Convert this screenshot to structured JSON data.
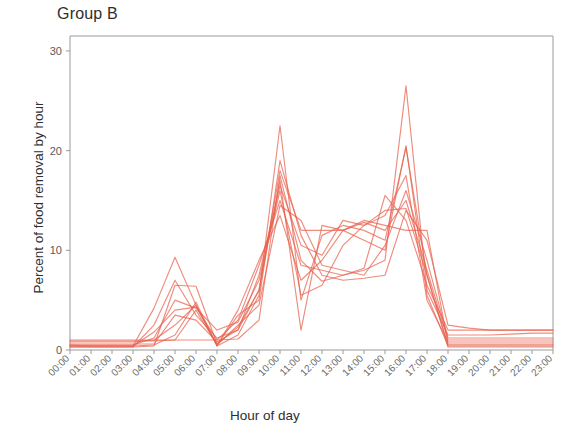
{
  "chart_data": {
    "type": "line",
    "title": "Group B",
    "xlabel": "Hour of day",
    "ylabel": "Percent of food removal by hour",
    "grid": false,
    "legend": false,
    "legend_position": "none",
    "line_color": "#e8604c",
    "line_opacity": 0.72,
    "ylim": [
      0,
      31.5
    ],
    "yticks": [
      0,
      10,
      20,
      30
    ],
    "ytick_labels": [
      "0",
      "10",
      "20",
      "30"
    ],
    "xlim": [
      0,
      23
    ],
    "x": [
      0,
      1,
      2,
      3,
      4,
      5,
      6,
      7,
      8,
      9,
      10,
      11,
      12,
      13,
      14,
      15,
      16,
      17,
      18,
      19,
      20,
      21,
      22,
      23
    ],
    "categories": [
      "00:00",
      "01:00",
      "02:00",
      "03:00",
      "04:00",
      "05:00",
      "06:00",
      "07:00",
      "08:00",
      "09:00",
      "10:00",
      "11:00",
      "12:00",
      "13:00",
      "14:00",
      "15:00",
      "16:00",
      "17:00",
      "18:00",
      "19:00",
      "20:00",
      "21:00",
      "22:00",
      "23:00"
    ],
    "series": [
      {
        "name": "subject-1",
        "values": [
          1.0,
          1.0,
          1.0,
          1.0,
          1.0,
          1.0,
          1.0,
          1.0,
          1.1,
          3.0,
          17.5,
          9.0,
          6.9,
          7.5,
          8.0,
          9.0,
          26.5,
          6.0,
          1.5,
          1.5,
          1.5,
          1.6,
          1.7,
          1.7
        ]
      },
      {
        "name": "subject-2",
        "values": [
          0.5,
          0.4,
          0.4,
          0.4,
          4.2,
          9.3,
          4.5,
          0.4,
          1.5,
          5.5,
          22.5,
          5.0,
          11.5,
          12.5,
          12.0,
          11.0,
          20.3,
          7.5,
          0.5,
          0.5,
          0.5,
          0.5,
          0.5,
          0.5
        ]
      },
      {
        "name": "subject-3",
        "values": [
          0.3,
          0.3,
          0.3,
          0.3,
          0.4,
          6.5,
          6.4,
          0.6,
          2.3,
          6.0,
          18.0,
          12.0,
          12.0,
          12.0,
          12.8,
          12.0,
          15.0,
          8.0,
          1.0,
          1.0,
          1.0,
          1.0,
          1.0,
          1.0
        ]
      },
      {
        "name": "subject-4",
        "values": [
          0.6,
          0.6,
          0.6,
          0.6,
          0.6,
          3.5,
          3.0,
          0.8,
          2.0,
          7.5,
          16.5,
          10.5,
          9.5,
          13.0,
          12.5,
          14.0,
          14.2,
          7.5,
          0.3,
          0.3,
          0.3,
          0.3,
          0.3,
          0.3
        ]
      },
      {
        "name": "subject-5",
        "values": [
          0.4,
          0.4,
          0.4,
          0.4,
          1.8,
          4.0,
          4.3,
          1.0,
          3.0,
          8.5,
          15.0,
          8.5,
          8.0,
          7.5,
          8.2,
          15.5,
          13.0,
          6.5,
          2.0,
          2.0,
          2.0,
          2.0,
          2.0,
          2.0
        ]
      },
      {
        "name": "subject-6",
        "values": [
          0.8,
          0.8,
          0.8,
          0.8,
          1.0,
          2.5,
          4.5,
          0.5,
          2.5,
          4.5,
          14.5,
          13.0,
          8.5,
          8.0,
          7.5,
          10.5,
          16.0,
          9.0,
          1.2,
          1.2,
          1.2,
          1.2,
          1.2,
          1.2
        ]
      },
      {
        "name": "subject-7",
        "values": [
          0.4,
          0.4,
          0.4,
          0.4,
          0.5,
          1.5,
          4.8,
          0.4,
          4.0,
          9.0,
          13.5,
          7.0,
          9.0,
          12.0,
          11.0,
          10.0,
          20.5,
          5.5,
          0.4,
          0.4,
          0.4,
          0.4,
          0.4,
          0.4
        ]
      },
      {
        "name": "subject-8",
        "values": [
          0.3,
          0.3,
          0.3,
          0.3,
          2.5,
          7.0,
          3.5,
          1.2,
          2.0,
          6.0,
          17.0,
          2.0,
          12.5,
          12.0,
          13.0,
          12.5,
          12.0,
          12.0,
          0.6,
          0.6,
          0.6,
          0.6,
          0.6,
          0.6
        ]
      },
      {
        "name": "subject-9",
        "values": [
          0.9,
          0.9,
          0.9,
          0.9,
          0.9,
          1.0,
          4.0,
          0.5,
          3.5,
          5.0,
          19.0,
          11.5,
          7.5,
          7.0,
          7.2,
          7.5,
          14.0,
          11.0,
          2.5,
          2.2,
          2.0,
          2.0,
          2.0,
          2.0
        ]
      },
      {
        "name": "subject-10",
        "values": [
          0.5,
          0.5,
          0.5,
          0.5,
          1.2,
          5.0,
          4.2,
          2.0,
          2.8,
          7.0,
          16.0,
          5.5,
          6.5,
          10.5,
          12.5,
          13.5,
          17.5,
          5.0,
          0.8,
          0.8,
          0.8,
          0.8,
          0.8,
          0.8
        ]
      }
    ],
    "annotations": {
      "max_value": 26.5,
      "max_hour": "16:00",
      "secondary_peak_value": 22.5,
      "secondary_peak_hour": "10:00",
      "minor_peak_value": 9.3,
      "minor_peak_hour": "05:00"
    }
  }
}
